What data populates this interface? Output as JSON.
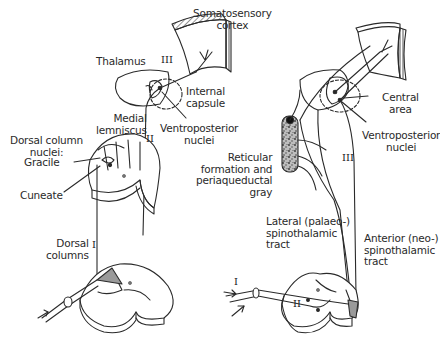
{
  "figure": {
    "left_panel": {
      "title": "Dorsal column - medial lemniscus pathway",
      "labels": {
        "cortex": "Somatosensory\ncortex",
        "thalamus": "Thalamus",
        "internal_capsule": "Internal\ncapsule",
        "medial_lemniscus": "Medial\nlemniscus",
        "ventroposterior": "Ventroposterior\nnuclei",
        "dorsal_column_nuclei": "Dorsal column\nnuclei:",
        "gracile": "Gracile",
        "cuneate": "Cuneate",
        "dorsal_columns": "Dorsal\ncolumns"
      },
      "neuron_orders": {
        "first": "I",
        "second": "II",
        "third": "III"
      }
    },
    "right_panel": {
      "title": "Spinothalamic pathways",
      "labels": {
        "central_area": "Central\narea",
        "ventroposterior": "Ventroposterior\nnuclei",
        "reticular": "Reticular\nformation and\nperiaqueductal\ngray",
        "lateral_tract": "Lateral (palaeo-)\nspinothalamic\ntract",
        "anterior_tract": "Anterior (neo-)\nspinothalamic\ntract"
      },
      "neuron_orders": {
        "first": "I",
        "second": "II",
        "third": "III"
      }
    },
    "colors": {
      "line": "#2a2a2a",
      "shade": "#9a9a9a",
      "background": "#ffffff"
    }
  }
}
